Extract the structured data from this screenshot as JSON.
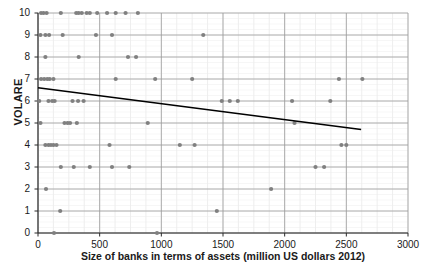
{
  "chart_data": {
    "type": "scatter",
    "title": "",
    "xlabel": "Size of banks in terms of assets (million US dollars 2012)",
    "ylabel": "VOLARE",
    "xlim": [
      0,
      3000
    ],
    "ylim": [
      0,
      10
    ],
    "xticks": [
      0,
      500,
      1000,
      1500,
      2000,
      2500,
      3000
    ],
    "yticks": [
      0,
      1,
      2,
      3,
      4,
      5,
      6,
      7,
      8,
      9,
      10
    ],
    "grid": true,
    "minor_grid": true,
    "legend": null,
    "marker_color": "#808080",
    "trendline_color": "#000000",
    "points": [
      [
        25,
        10
      ],
      [
        45,
        10
      ],
      [
        70,
        10
      ],
      [
        185,
        10
      ],
      [
        310,
        10
      ],
      [
        330,
        10
      ],
      [
        355,
        10
      ],
      [
        395,
        10
      ],
      [
        420,
        10
      ],
      [
        480,
        10
      ],
      [
        560,
        10
      ],
      [
        630,
        10
      ],
      [
        710,
        10
      ],
      [
        810,
        10
      ],
      [
        20,
        9
      ],
      [
        60,
        9
      ],
      [
        90,
        9
      ],
      [
        200,
        9
      ],
      [
        470,
        9
      ],
      [
        600,
        9
      ],
      [
        1340,
        9
      ],
      [
        60,
        8
      ],
      [
        330,
        8
      ],
      [
        730,
        8
      ],
      [
        795,
        8
      ],
      [
        25,
        7
      ],
      [
        50,
        7
      ],
      [
        75,
        7
      ],
      [
        95,
        7
      ],
      [
        125,
        7
      ],
      [
        630,
        7
      ],
      [
        950,
        7
      ],
      [
        1250,
        7
      ],
      [
        2440,
        7
      ],
      [
        2630,
        7
      ],
      [
        10,
        6
      ],
      [
        85,
        6
      ],
      [
        115,
        6
      ],
      [
        135,
        6
      ],
      [
        280,
        6
      ],
      [
        325,
        6
      ],
      [
        370,
        6
      ],
      [
        1490,
        6
      ],
      [
        1555,
        6
      ],
      [
        1620,
        6
      ],
      [
        2060,
        6
      ],
      [
        2370,
        6
      ],
      [
        20,
        5
      ],
      [
        215,
        5
      ],
      [
        240,
        5
      ],
      [
        260,
        5
      ],
      [
        315,
        5
      ],
      [
        890,
        5
      ],
      [
        2080,
        5
      ],
      [
        60,
        4
      ],
      [
        85,
        4
      ],
      [
        105,
        4
      ],
      [
        125,
        4
      ],
      [
        150,
        4
      ],
      [
        580,
        4
      ],
      [
        1150,
        4
      ],
      [
        1270,
        4
      ],
      [
        2460,
        4
      ],
      [
        2500,
        4
      ],
      [
        185,
        3
      ],
      [
        290,
        3
      ],
      [
        420,
        3
      ],
      [
        600,
        3
      ],
      [
        740,
        3
      ],
      [
        2250,
        3
      ],
      [
        2320,
        3
      ],
      [
        65,
        2
      ],
      [
        1890,
        2
      ],
      [
        180,
        1
      ],
      [
        1450,
        1
      ],
      [
        130,
        0
      ],
      [
        965,
        0
      ]
    ],
    "trendline": {
      "x_start": 0,
      "y_start": 6.6,
      "x_end": 2620,
      "y_end": 4.7
    }
  },
  "axes": {
    "y_tick_labels": [
      "10",
      "9",
      "8",
      "7",
      "6",
      "5",
      "4",
      "3",
      "2",
      "1",
      "0"
    ],
    "x_tick_labels": [
      "0",
      "500",
      "1000",
      "1500",
      "2000",
      "2500",
      "3000"
    ]
  }
}
